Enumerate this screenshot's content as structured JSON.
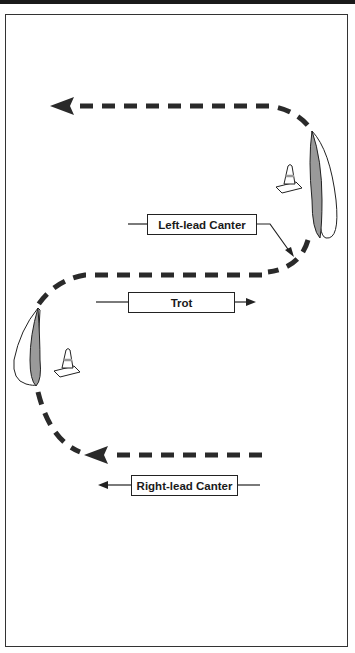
{
  "diagram": {
    "title": "",
    "labels": {
      "left_lead_canter": "Left-lead Canter",
      "trot": "Trot",
      "right_lead_canter": "Right-lead Canter"
    },
    "elements": [
      {
        "type": "cone",
        "position": "right-upper"
      },
      {
        "type": "cone",
        "position": "left-middle"
      },
      {
        "type": "shrub",
        "position": "right-upper"
      },
      {
        "type": "shrub",
        "position": "left-middle"
      }
    ],
    "path": {
      "style": "dashed",
      "direction_start": "bottom-right",
      "direction_end": "top-left"
    },
    "colors": {
      "line": "#2a2a2a",
      "shrub_fill": "#9a9a9a",
      "frame": "#333333"
    }
  }
}
